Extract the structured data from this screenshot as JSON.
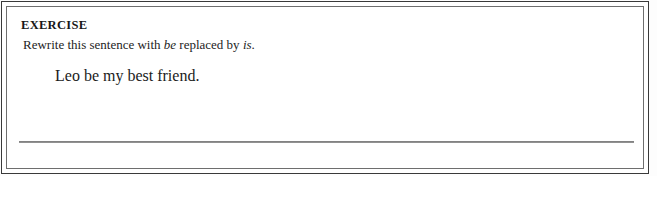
{
  "document": {
    "type": "worksheet-exercise-box",
    "heading": "EXERCISE",
    "instruction": {
      "prefix": "Rewrite this sentence with ",
      "italic_word_1": "be",
      "middle": " replaced by ",
      "italic_word_2": "is",
      "suffix": "."
    },
    "example_sentence": "Leo be my best friend.",
    "answer_line": {
      "label": "blank-answer-rule",
      "value": ""
    },
    "colors": {
      "page_background": "#ffffff",
      "outer_border": "#3a3a3a",
      "inner_border": "#6e6e6e",
      "text": "#1c1c1c",
      "rule": "#6a6a6a"
    }
  }
}
